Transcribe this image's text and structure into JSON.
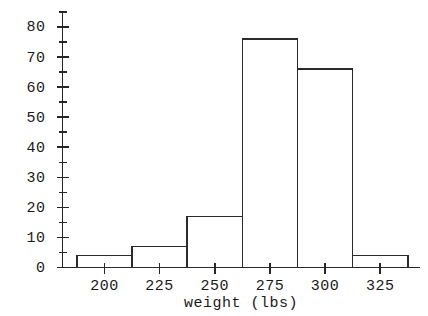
{
  "chart_data": {
    "type": "bar",
    "title": "",
    "xlabel": "weight (lbs)",
    "ylabel": "",
    "categories": [
      "187.5-212.5",
      "212.5-237.5",
      "237.5-262.5",
      "262.5-287.5",
      "287.5-312.5",
      "312.5-337.5"
    ],
    "bin_edges": [
      187.5,
      212.5,
      237.5,
      262.5,
      287.5,
      312.5,
      337.5
    ],
    "values": [
      4,
      7,
      17,
      76,
      66,
      4
    ],
    "xlim": [
      181,
      343
    ],
    "ylim": [
      0,
      85
    ],
    "x_ticks": [
      200,
      225,
      250,
      275,
      300,
      325
    ],
    "x_tick_labels": [
      "200",
      "225",
      "250",
      "275",
      "300",
      "325"
    ],
    "y_ticks_major": [
      0,
      10,
      20,
      30,
      40,
      50,
      60,
      70,
      80
    ],
    "y_tick_labels": [
      "0",
      "10",
      "20",
      "30",
      "40",
      "50",
      "60",
      "70",
      "80"
    ],
    "y_ticks_minor": [
      5,
      15,
      25,
      35,
      45,
      55,
      65,
      75,
      85
    ],
    "grid": false,
    "legend": false,
    "bar_fill": "#ffffff",
    "bar_stroke": "#2b2b2b",
    "axis_color": "#262626"
  },
  "axis": {
    "x_title": "weight (lbs)"
  }
}
